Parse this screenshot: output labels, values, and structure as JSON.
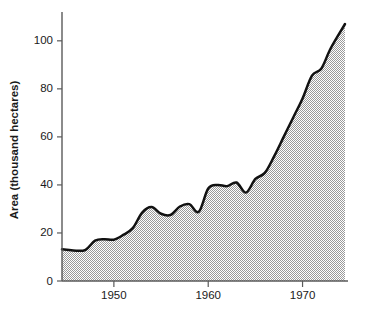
{
  "chart_data": {
    "type": "area",
    "title": "",
    "xlabel": "",
    "ylabel": "Area (thousand hectares)",
    "xlim": [
      1944.5,
      1974.5
    ],
    "ylim": [
      0,
      112
    ],
    "grid": false,
    "legend": null,
    "x_ticks": [
      1950,
      1960,
      1970
    ],
    "x_tick_labels": [
      "1950",
      "1960",
      "1970"
    ],
    "y_ticks": [
      0,
      20,
      40,
      60,
      80,
      100
    ],
    "y_tick_labels": [
      "0",
      "20",
      "40",
      "60",
      "80",
      "100"
    ],
    "x": [
      1944.5,
      1945,
      1946,
      1947,
      1948,
      1949,
      1950,
      1951,
      1952,
      1953,
      1954,
      1955,
      1956,
      1957,
      1958,
      1959,
      1960,
      1961,
      1962,
      1963,
      1964,
      1965,
      1966,
      1967,
      1968,
      1969,
      1970,
      1971,
      1972,
      1973,
      1974.5
    ],
    "values": [
      13.2,
      13.0,
      12.6,
      13.0,
      16.8,
      17.4,
      17.2,
      19.2,
      22.0,
      28.5,
      30.8,
      28.0,
      27.5,
      31.0,
      32.0,
      28.8,
      38.5,
      40.0,
      39.5,
      41.0,
      36.8,
      42.5,
      45.0,
      52.0,
      60.0,
      68.0,
      76.0,
      85.5,
      88.5,
      97.0,
      107.0
    ],
    "series": [
      {
        "name": "Area",
        "fill_color": "#d0d0d0",
        "line_color": "#111111",
        "fill_pattern": "fine-stipple",
        "values": [
          13.2,
          13.0,
          12.6,
          13.0,
          16.8,
          17.4,
          17.2,
          19.2,
          22.0,
          28.5,
          30.8,
          28.0,
          27.5,
          31.0,
          32.0,
          28.8,
          38.5,
          40.0,
          39.5,
          41.0,
          36.8,
          42.5,
          45.0,
          52.0,
          60.0,
          68.0,
          76.0,
          85.5,
          88.5,
          97.0,
          107.0
        ]
      }
    ],
    "peak_value": 107.0,
    "peak_x": 1974.5,
    "start_value": 13.2,
    "start_x": 1944.5
  },
  "colors": {
    "axis": "#5a5a5a",
    "line": "#111111",
    "fill": "#d0d0d0",
    "text": "#1a1a1a",
    "background": "#ffffff"
  }
}
